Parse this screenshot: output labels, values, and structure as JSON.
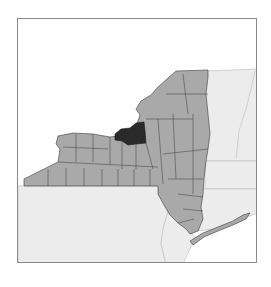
{
  "map": {
    "subject": "New York State counties",
    "highlighted_county": "Oswego County",
    "colors": {
      "county_fill": "#a9a9a9",
      "county_stroke": "#3a3a3a",
      "highlight_fill": "#2a2a2a",
      "neighbor_fill": "#ececec",
      "water": "#ffffff",
      "frame_border": "#8a8a8a"
    }
  }
}
